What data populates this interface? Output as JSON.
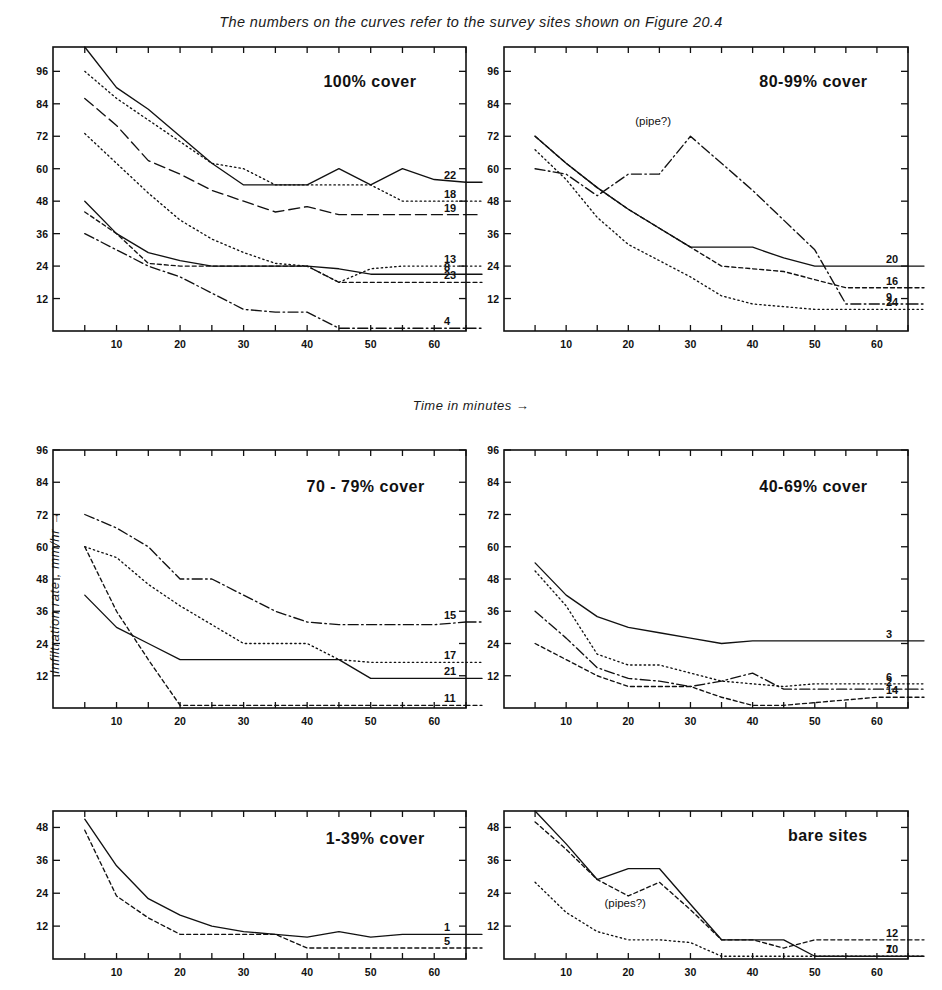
{
  "figure": {
    "caption": "The numbers on the curves refer to the survey sites shown on Figure 20.4",
    "xlabel": "Time in minutes  →",
    "ylabel": "Infiltration rate , mm/hr  →"
  },
  "chart_data": [
    {
      "id": "panel-100-cover",
      "type": "line",
      "title": "100% cover",
      "xlabel": "Time in minutes",
      "ylabel": "Infiltration rate, mm/hr",
      "xlim": [
        0,
        65
      ],
      "ylim": [
        0,
        105
      ],
      "xticks": [
        5,
        10,
        15,
        20,
        25,
        30,
        35,
        40,
        45,
        50,
        55,
        60,
        65
      ],
      "xticklabels": [
        10,
        20,
        30,
        40,
        50,
        60
      ],
      "yticks": [
        12,
        24,
        36,
        48,
        60,
        72,
        84,
        96
      ],
      "grid": false,
      "annotations": [],
      "series": [
        {
          "name": "22",
          "style": "solid",
          "x": [
            5,
            10,
            15,
            20,
            25,
            30,
            35,
            40,
            45,
            50,
            55,
            60,
            65
          ],
          "values": [
            105,
            90,
            82,
            72,
            62,
            54,
            54,
            54,
            60,
            54,
            60,
            56,
            55
          ]
        },
        {
          "name": "18",
          "style": "dotted",
          "x": [
            5,
            10,
            15,
            20,
            25,
            30,
            35,
            40,
            45,
            50,
            55,
            60,
            65
          ],
          "values": [
            96,
            86,
            78,
            70,
            62,
            60,
            54,
            54,
            54,
            54,
            48,
            48,
            48
          ]
        },
        {
          "name": "19",
          "style": "dashed-long",
          "x": [
            5,
            10,
            15,
            20,
            25,
            30,
            35,
            40,
            45,
            50,
            55,
            60,
            65
          ],
          "values": [
            86,
            76,
            63,
            58,
            52,
            48,
            44,
            46,
            43,
            43,
            43,
            43,
            43
          ]
        },
        {
          "name": "13",
          "style": "dotted",
          "x": [
            5,
            10,
            15,
            20,
            25,
            30,
            35,
            40,
            45,
            50,
            55,
            60,
            65
          ],
          "values": [
            73,
            62,
            51,
            41,
            34,
            29,
            25,
            24,
            18,
            23,
            24,
            24,
            24
          ]
        },
        {
          "name": "8",
          "style": "solid",
          "x": [
            5,
            10,
            15,
            20,
            25,
            30,
            35,
            40,
            45,
            50,
            55,
            60,
            65
          ],
          "values": [
            48,
            36,
            29,
            26,
            24,
            24,
            24,
            24,
            23,
            21,
            21,
            21,
            21
          ]
        },
        {
          "name": "23",
          "style": "dashed-short",
          "x": [
            5,
            10,
            15,
            20,
            25,
            30,
            35,
            40,
            45,
            50,
            55,
            60,
            65
          ],
          "values": [
            44,
            36,
            25,
            24,
            24,
            24,
            24,
            24,
            18,
            18,
            18,
            18,
            18
          ]
        },
        {
          "name": "4",
          "style": "dash-dot",
          "x": [
            5,
            10,
            15,
            20,
            25,
            30,
            35,
            40,
            45,
            50,
            55,
            60,
            65
          ],
          "values": [
            36,
            30,
            24,
            20,
            14,
            8,
            7,
            7,
            1,
            1,
            1,
            1,
            1
          ]
        }
      ]
    },
    {
      "id": "panel-80-99-cover",
      "type": "line",
      "title": "80-99% cover",
      "xlim": [
        0,
        65
      ],
      "ylim": [
        0,
        105
      ],
      "xticks": [
        5,
        10,
        15,
        20,
        25,
        30,
        35,
        40,
        45,
        50,
        55,
        60,
        65
      ],
      "xticklabels": [
        10,
        20,
        30,
        40,
        50,
        60
      ],
      "yticks": [
        12,
        24,
        36,
        48,
        60,
        72,
        84,
        96
      ],
      "grid": false,
      "annotations": [
        {
          "text": "(pipe?)",
          "x": 24,
          "y": 76
        }
      ],
      "series": [
        {
          "name": "20",
          "style": "solid",
          "x": [
            5,
            10,
            15,
            20,
            25,
            30,
            35,
            40,
            45,
            50,
            55,
            60,
            65
          ],
          "values": [
            72,
            62,
            53,
            45,
            38,
            31,
            31,
            31,
            27,
            24,
            24,
            24,
            24
          ]
        },
        {
          "name": "16",
          "style": "dashed-short",
          "x": [
            5,
            10,
            15,
            20,
            25,
            30,
            35,
            40,
            45,
            50,
            55,
            60,
            65
          ],
          "values": [
            72,
            62,
            53,
            45,
            38,
            31,
            24,
            23,
            22,
            19,
            16,
            16,
            16
          ]
        },
        {
          "name": "9",
          "style": "dash-dot",
          "x": [
            5,
            10,
            15,
            20,
            25,
            30,
            35,
            40,
            45,
            50,
            55,
            60,
            65
          ],
          "values": [
            60,
            58,
            50,
            58,
            58,
            72,
            62,
            52,
            41,
            30,
            10,
            10,
            10
          ]
        },
        {
          "name": "24",
          "style": "dotted",
          "x": [
            5,
            10,
            15,
            20,
            25,
            30,
            35,
            40,
            45,
            50,
            55,
            60,
            65
          ],
          "values": [
            67,
            56,
            42,
            32,
            26,
            20,
            13,
            10,
            9,
            8,
            8,
            8,
            8
          ]
        }
      ]
    },
    {
      "id": "panel-70-79-cover",
      "type": "line",
      "title": "70 - 79% cover",
      "xlim": [
        0,
        65
      ],
      "ylim": [
        0,
        96
      ],
      "xticks": [
        5,
        10,
        15,
        20,
        25,
        30,
        35,
        40,
        45,
        50,
        55,
        60,
        65
      ],
      "xticklabels": [
        10,
        20,
        30,
        40,
        50,
        60
      ],
      "yticks": [
        12,
        24,
        36,
        48,
        60,
        72,
        84,
        96
      ],
      "grid": false,
      "annotations": [],
      "series": [
        {
          "name": "15",
          "style": "dash-dot",
          "x": [
            5,
            10,
            15,
            20,
            25,
            30,
            35,
            40,
            45,
            50,
            55,
            60,
            65
          ],
          "values": [
            72,
            67,
            60,
            48,
            48,
            42,
            36,
            32,
            31,
            31,
            31,
            31,
            32
          ]
        },
        {
          "name": "17",
          "style": "dotted",
          "x": [
            5,
            10,
            15,
            20,
            25,
            30,
            35,
            40,
            45,
            50,
            55,
            60,
            65
          ],
          "values": [
            60,
            56,
            46,
            38,
            31,
            24,
            24,
            24,
            18,
            17,
            17,
            17,
            17
          ]
        },
        {
          "name": "21",
          "style": "solid",
          "x": [
            5,
            10,
            15,
            20,
            25,
            30,
            35,
            40,
            45,
            50,
            55,
            60,
            65
          ],
          "values": [
            42,
            30,
            24,
            18,
            18,
            18,
            18,
            18,
            18,
            11,
            11,
            11,
            11
          ]
        },
        {
          "name": "11",
          "style": "dashed-short",
          "x": [
            5,
            10,
            15,
            20,
            25,
            30,
            35,
            40,
            45,
            50,
            55,
            60,
            65
          ],
          "values": [
            60,
            36,
            18,
            1,
            1,
            1,
            1,
            1,
            1,
            1,
            1,
            1,
            1
          ]
        }
      ]
    },
    {
      "id": "panel-40-69-cover",
      "type": "line",
      "title": "40-69% cover",
      "xlim": [
        0,
        65
      ],
      "ylim": [
        0,
        96
      ],
      "xticks": [
        5,
        10,
        15,
        20,
        25,
        30,
        35,
        40,
        45,
        50,
        55,
        60,
        65
      ],
      "xticklabels": [
        10,
        20,
        30,
        40,
        50,
        60
      ],
      "yticks": [
        12,
        24,
        36,
        48,
        60,
        72,
        84,
        96
      ],
      "grid": false,
      "annotations": [],
      "series": [
        {
          "name": "3",
          "style": "solid",
          "x": [
            5,
            10,
            15,
            20,
            25,
            30,
            35,
            40,
            45,
            50,
            55,
            60,
            65
          ],
          "values": [
            54,
            42,
            34,
            30,
            28,
            26,
            24,
            25,
            25,
            25,
            25,
            25,
            25
          ]
        },
        {
          "name": "6",
          "style": "dotted",
          "x": [
            5,
            10,
            15,
            20,
            25,
            30,
            35,
            40,
            45,
            50,
            55,
            60,
            65
          ],
          "values": [
            51,
            38,
            20,
            16,
            16,
            13,
            10,
            9,
            8,
            9,
            9,
            9,
            9
          ]
        },
        {
          "name": "2",
          "style": "dash-dot",
          "x": [
            5,
            10,
            15,
            20,
            25,
            30,
            35,
            40,
            45,
            50,
            55,
            60,
            65
          ],
          "values": [
            36,
            26,
            15,
            11,
            10,
            8,
            10,
            13,
            7,
            7,
            7,
            7,
            7
          ]
        },
        {
          "name": "14",
          "style": "dashed-short",
          "x": [
            5,
            10,
            15,
            20,
            25,
            30,
            35,
            40,
            45,
            50,
            55,
            60,
            65
          ],
          "values": [
            24,
            18,
            12,
            8,
            8,
            8,
            4,
            1,
            1,
            2,
            3,
            4,
            4
          ]
        }
      ]
    },
    {
      "id": "panel-1-39-cover",
      "type": "line",
      "title": "1-39% cover",
      "xlim": [
        0,
        65
      ],
      "ylim": [
        0,
        54
      ],
      "xticks": [
        5,
        10,
        15,
        20,
        25,
        30,
        35,
        40,
        45,
        50,
        55,
        60,
        65
      ],
      "xticklabels": [
        10,
        20,
        30,
        40,
        50,
        60
      ],
      "yticks": [
        12,
        24,
        36,
        48
      ],
      "grid": false,
      "annotations": [],
      "series": [
        {
          "name": "1",
          "style": "solid",
          "x": [
            5,
            10,
            15,
            20,
            25,
            30,
            35,
            40,
            45,
            50,
            55,
            60,
            65
          ],
          "values": [
            51,
            34,
            22,
            16,
            12,
            10,
            9,
            8,
            10,
            8,
            9,
            9,
            9
          ]
        },
        {
          "name": "5",
          "style": "dashed-short",
          "x": [
            5,
            10,
            15,
            20,
            25,
            30,
            35,
            40,
            45,
            50,
            55,
            60,
            65
          ],
          "values": [
            47,
            23,
            15,
            9,
            9,
            9,
            9,
            4,
            4,
            4,
            4,
            4,
            4
          ]
        }
      ]
    },
    {
      "id": "panel-bare-sites",
      "type": "line",
      "title": "bare sites",
      "xlim": [
        0,
        65
      ],
      "ylim": [
        0,
        54
      ],
      "xticks": [
        5,
        10,
        15,
        20,
        25,
        30,
        35,
        40,
        45,
        50,
        55,
        60,
        65
      ],
      "xticklabels": [
        10,
        20,
        30,
        40,
        50,
        60
      ],
      "yticks": [
        12,
        24,
        36,
        48
      ],
      "grid": false,
      "annotations": [
        {
          "text": "(pipes?)",
          "x": 19.5,
          "y": 19
        }
      ],
      "series": [
        {
          "name": "10",
          "style": "solid",
          "x": [
            5,
            10,
            15,
            20,
            25,
            30,
            35,
            40,
            45,
            50,
            55,
            60,
            65
          ],
          "values": [
            54,
            42,
            29,
            33,
            33,
            20,
            7,
            7,
            7,
            1,
            1,
            1,
            1
          ]
        },
        {
          "name": "12",
          "style": "dashed-short",
          "x": [
            5,
            10,
            15,
            20,
            25,
            30,
            35,
            40,
            45,
            50,
            55,
            60,
            65
          ],
          "values": [
            50,
            40,
            29,
            23,
            28,
            18,
            7,
            7,
            4,
            7,
            7,
            7,
            7
          ]
        },
        {
          "name": "7",
          "style": "dotted",
          "x": [
            5,
            10,
            15,
            20,
            25,
            30,
            35,
            40,
            45,
            50,
            55,
            60,
            65
          ],
          "values": [
            28,
            17,
            10,
            7,
            7,
            6,
            1,
            1,
            1,
            1,
            1,
            1,
            1
          ]
        }
      ]
    }
  ],
  "panel_layout": [
    {
      "id": "panel-100-cover",
      "left": 53,
      "top": 47,
      "width": 413,
      "height": 284,
      "title_x": 0.88,
      "title_y": 0.88
    },
    {
      "id": "panel-80-99-cover",
      "left": 504,
      "top": 47,
      "width": 404,
      "height": 284,
      "title_x": 0.9,
      "title_y": 0.88
    },
    {
      "id": "panel-70-79-cover",
      "left": 53,
      "top": 450,
      "width": 413,
      "height": 258,
      "title_x": 0.9,
      "title_y": 0.86
    },
    {
      "id": "panel-40-69-cover",
      "left": 504,
      "top": 450,
      "width": 404,
      "height": 258,
      "title_x": 0.9,
      "title_y": 0.86
    },
    {
      "id": "panel-1-39-cover",
      "left": 53,
      "top": 811,
      "width": 413,
      "height": 148,
      "title_x": 0.9,
      "title_y": 0.82
    },
    {
      "id": "panel-bare-sites",
      "left": 504,
      "top": 811,
      "width": 404,
      "height": 148,
      "title_x": 0.9,
      "title_y": 0.84
    }
  ]
}
